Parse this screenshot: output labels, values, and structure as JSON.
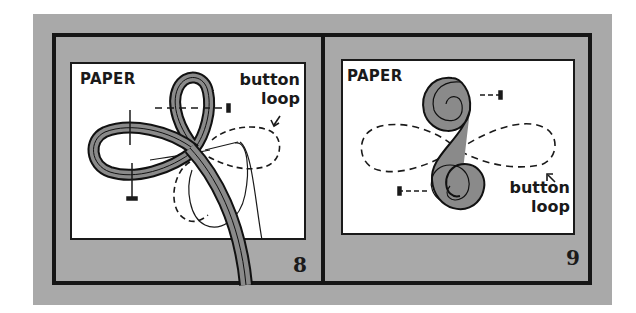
{
  "diagram": {
    "type": "instructional-illustration",
    "colors": {
      "background_gray": "#a9a9a9",
      "frame": "#161616",
      "paper": "#ffffff",
      "cord_fill": "#8a8a8a"
    },
    "panels": [
      {
        "step": "8",
        "paper_label": "PAPER",
        "callout_line1": "button",
        "callout_line2": "loop"
      },
      {
        "step": "9",
        "paper_label": "PAPER",
        "callout_line1": "button",
        "callout_line2": "loop"
      }
    ]
  }
}
